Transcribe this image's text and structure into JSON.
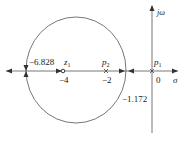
{
  "diagram": {
    "type": "root-locus",
    "axes": {
      "real_axis_label": "σ",
      "imag_axis_label": "jω",
      "origin_label": "0"
    },
    "zeros": [
      {
        "name": "z",
        "sub": "1",
        "value": "−4"
      }
    ],
    "poles": [
      {
        "name": "p",
        "sub": "2",
        "value": "−2"
      },
      {
        "name": "p",
        "sub": "1",
        "value": "0"
      }
    ],
    "breakpoints": [
      {
        "label": "−6.828"
      },
      {
        "label": "−1.172"
      }
    ],
    "colors": {
      "line": "#555555",
      "text": "#222222"
    }
  }
}
